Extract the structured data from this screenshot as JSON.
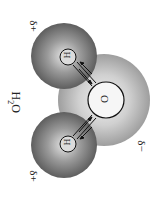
{
  "diagram": {
    "title": "H2O",
    "title_main": "H",
    "title_sub": "2",
    "title_end": "O",
    "atoms": {
      "oxygen": "O",
      "hydrogen_top": "H",
      "hydrogen_bottom": "H"
    },
    "charges": {
      "hydrogen_top": "δ+",
      "hydrogen_bottom": "δ+",
      "oxygen": "δ−"
    },
    "colors": {
      "oxygen_cloud": "#b4b4b4",
      "hydrogen_cloud": "#7a7a7a",
      "outline": "#111111"
    }
  }
}
